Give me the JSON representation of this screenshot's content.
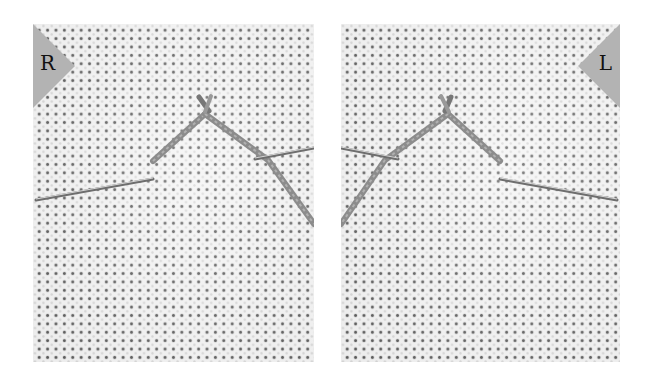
{
  "panels": [
    {
      "id": "right-handed",
      "corner_label": "R",
      "corner_position": "top-left",
      "description": "Needle entering from left; diagonal stitch forming inverted V on even-weave fabric"
    },
    {
      "id": "left-handed",
      "corner_label": "L",
      "corner_position": "top-right",
      "description": "Mirror image: needle entering from right; diagonal stitch forming inverted V"
    }
  ],
  "colors": {
    "background": "#ffffff",
    "fabric": "#f4f4f4",
    "fabric_holes": "#3a3a3a",
    "corner_badge": "#b3b3b3",
    "thread": "#8c8c8c",
    "needle": "#6e6e6e"
  }
}
